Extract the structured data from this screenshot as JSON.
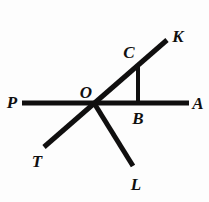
{
  "figure": {
    "background_color": "#fdfdfd",
    "stroke_color": "#100f0f",
    "width": 209,
    "height": 202
  },
  "labels": {
    "P": "P",
    "A": "A",
    "K": "K",
    "T": "T",
    "L": "L",
    "O": "O",
    "B": "B",
    "C": "C"
  },
  "label_positions": {
    "P": {
      "x": 12,
      "y": 102
    },
    "A": {
      "x": 198,
      "y": 103
    },
    "K": {
      "x": 178,
      "y": 36
    },
    "T": {
      "x": 37,
      "y": 161
    },
    "L": {
      "x": 136,
      "y": 184
    },
    "O": {
      "x": 86,
      "y": 92
    },
    "B": {
      "x": 138,
      "y": 118
    },
    "C": {
      "x": 129,
      "y": 52
    }
  },
  "geometry": {
    "vertex_O": {
      "x": 94,
      "y": 103
    },
    "point_B": {
      "x": 138,
      "y": 103
    },
    "point_C": {
      "x": 138,
      "y": 66
    },
    "segments": [
      {
        "name": "line-PA",
        "x1": 22,
        "y1": 103,
        "x2": 189,
        "y2": 103,
        "width": 5
      },
      {
        "name": "line-TK",
        "x1": 44,
        "y1": 147,
        "x2": 167,
        "y2": 40,
        "width": 5
      },
      {
        "name": "ray-OL",
        "x1": 94,
        "y1": 103,
        "x2": 133,
        "y2": 166,
        "width": 5
      },
      {
        "name": "segment-CB",
        "x1": 138,
        "y1": 66,
        "x2": 138,
        "y2": 104,
        "width": 4
      }
    ]
  }
}
